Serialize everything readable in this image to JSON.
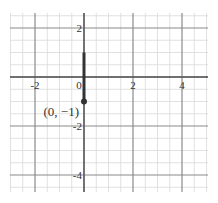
{
  "chart_data": {
    "type": "line",
    "title": "",
    "xlabel": "",
    "ylabel": "",
    "xlim": [
      -3,
      5
    ],
    "ylim": [
      -4.5,
      2.5
    ],
    "grid": true,
    "minor_step": 0.5,
    "major_step": 2,
    "x_ticks": [
      {
        "value": -2,
        "label": "-2"
      },
      {
        "value": 0,
        "label": "0"
      },
      {
        "value": 2,
        "label": "2"
      },
      {
        "value": 4,
        "label": "4"
      }
    ],
    "y_ticks": [
      {
        "value": 2,
        "label": "2"
      },
      {
        "value": -2,
        "label": "-2"
      },
      {
        "value": -4,
        "label": "-4"
      }
    ],
    "series": [
      {
        "name": "vertical segment",
        "points": [
          [
            0,
            1
          ],
          [
            0,
            -1
          ]
        ],
        "color": "#333333",
        "endpoint_marker": {
          "point": [
            0,
            -1
          ],
          "style": "filled"
        }
      }
    ],
    "annotations": [
      {
        "text": "(0, −1)",
        "at": [
          0,
          -1
        ]
      }
    ],
    "colors": {
      "minor_grid": "#d9d9d9",
      "major_grid": "#8a8a8a",
      "axis": "#555555",
      "segment": "#333333"
    }
  }
}
